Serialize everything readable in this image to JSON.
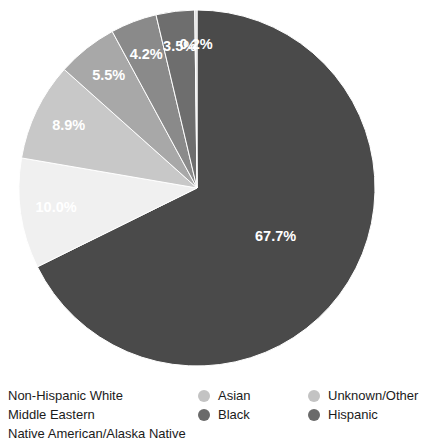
{
  "chart_data": {
    "type": "pie",
    "title": "",
    "subtitle": "",
    "xlabel": "",
    "ylabel": "",
    "grid": false,
    "legend_position": "bottom",
    "categories": [
      "Non-Hispanic White",
      "Hispanic",
      "Black",
      "Asian",
      "Middle Eastern",
      "Unknown/Other",
      "Native American/Alaska Native"
    ],
    "values": [
      67.7,
      10.0,
      8.9,
      5.5,
      4.2,
      3.5,
      0.2
    ],
    "labels": [
      "67.7%",
      "10.0%",
      "8.9%",
      "5.5%",
      "4.2%",
      "3.5%",
      "0.2%"
    ],
    "colors": [
      "#4a4a4a",
      "#f0f0f0",
      "#c8c8c8",
      "#a8a8a8",
      "#8a8a8a",
      "#6e6e6e",
      "#d8d8d8"
    ],
    "slices": [
      {
        "name": "Non-Hispanic White",
        "value": 67.7,
        "label": "67.7%",
        "color": "#4a4a4a"
      },
      {
        "name": "Hispanic",
        "value": 10.0,
        "label": "10.0%",
        "color": "#f0f0f0"
      },
      {
        "name": "Black",
        "value": 8.9,
        "label": "8.9%",
        "color": "#c8c8c8"
      },
      {
        "name": "Asian",
        "value": 5.5,
        "label": "5.5%",
        "color": "#a8a8a8"
      },
      {
        "name": "Middle Eastern",
        "value": 4.2,
        "label": "4.2%",
        "color": "#8a8a8a"
      },
      {
        "name": "Unknown/Other",
        "value": 3.5,
        "label": "3.5%",
        "color": "#6e6e6e"
      },
      {
        "name": "Native American/Alaska Native",
        "value": 0.2,
        "label": "0.2%",
        "color": "#d8d8d8"
      }
    ],
    "geometry": {
      "cx": 197,
      "cy": 188,
      "r": 178,
      "start_angle_deg": -90,
      "direction": "clockwise"
    }
  },
  "legend": {
    "columns": [
      {
        "entries": [
          {
            "label": "Non-Hispanic White",
            "color": "#4a4a4a"
          },
          {
            "label": "Middle Eastern",
            "color": "#8a8a8a"
          },
          {
            "label": "Native American/Alaska Native",
            "color": "#4a4a4a"
          }
        ]
      },
      {
        "entries": [
          {
            "label": "Asian",
            "color": "#c3c3c3"
          },
          {
            "label": "Black",
            "color": "#6a6a6a"
          }
        ]
      },
      {
        "entries": [
          {
            "label": "Unknown/Other",
            "color": "#c3c3c3"
          },
          {
            "label": "Hispanic",
            "color": "#6a6a6a"
          }
        ]
      }
    ]
  }
}
